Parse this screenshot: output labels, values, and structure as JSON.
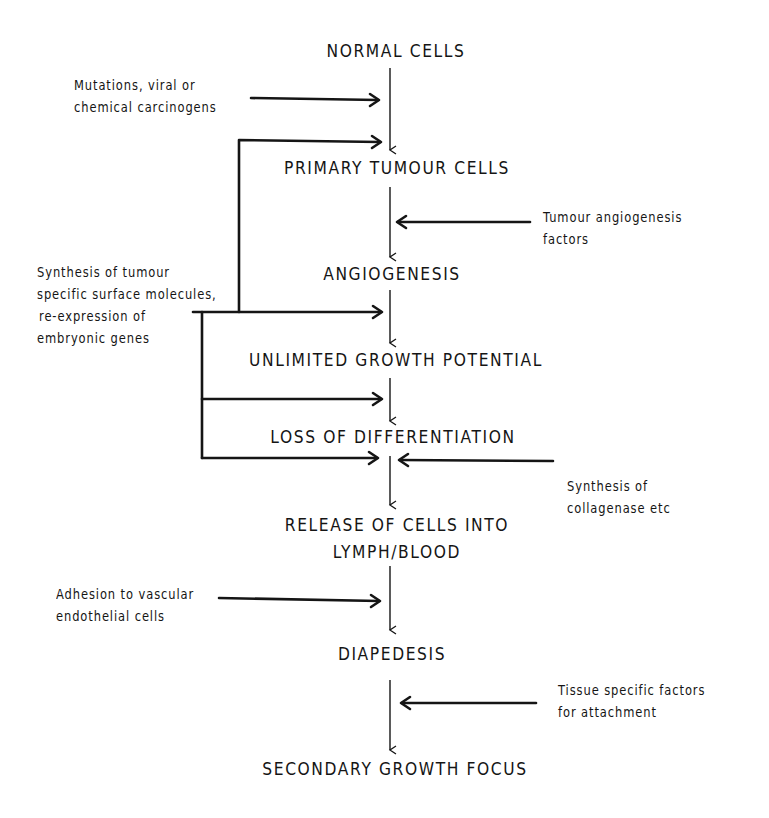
{
  "diagram": {
    "type": "flowchart",
    "stages": [
      {
        "id": "normal",
        "label": "NORMAL CELLS"
      },
      {
        "id": "primary",
        "label": "PRIMARY TUMOUR CELLS"
      },
      {
        "id": "angiogenesis",
        "label": "ANGIOGENESIS"
      },
      {
        "id": "unlimited",
        "label": "UNLIMITED GROWTH POTENTIAL"
      },
      {
        "id": "loss",
        "label": "LOSS OF DIFFERENTIATION"
      },
      {
        "id": "release",
        "label_line1": "RELEASE OF CELLS INTO",
        "label_line2": "LYMPH/BLOOD"
      },
      {
        "id": "diapedesis",
        "label": "DIAPEDESIS"
      },
      {
        "id": "secondary",
        "label": "SECONDARY GROWTH FOCUS"
      }
    ],
    "factors": {
      "mutations": {
        "line1": "Mutations, viral or",
        "line2": "chemical carcinogens",
        "side": "left",
        "targets": [
          "normal->primary"
        ]
      },
      "angiogenesis_factors": {
        "line1": "Tumour angiogenesis",
        "line2": "factors",
        "side": "right",
        "targets": [
          "primary->angiogenesis"
        ]
      },
      "synthesis_surface": {
        "line1": "Synthesis of tumour",
        "line2": "specific surface molecules,",
        "line3": "re-expression of",
        "line4": "embryonic genes",
        "side": "left",
        "targets": [
          "normal->primary",
          "angiogenesis->unlimited",
          "unlimited->loss",
          "loss->release"
        ]
      },
      "collagenase": {
        "line1": "Synthesis of",
        "line2": "collagenase etc",
        "side": "right",
        "targets": [
          "loss->release"
        ]
      },
      "adhesion": {
        "line1": "Adhesion to vascular",
        "line2": "endothelial cells",
        "side": "left",
        "targets": [
          "release->diapedesis"
        ]
      },
      "tissue_factors": {
        "line1": "Tissue specific factors",
        "line2": "for attachment",
        "side": "right",
        "targets": [
          "diapedesis->secondary"
        ]
      }
    },
    "colors": {
      "background": "#ffffff",
      "ink": "#151515"
    }
  }
}
